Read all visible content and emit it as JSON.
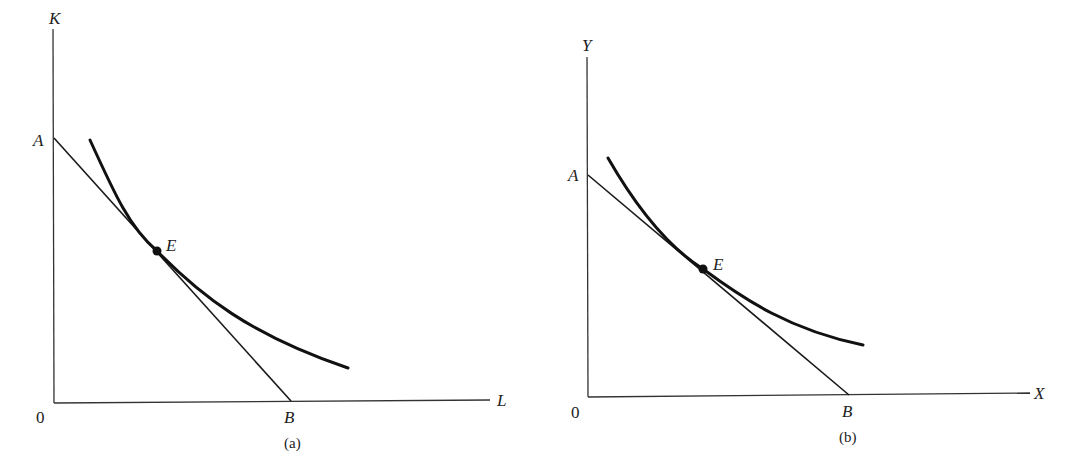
{
  "panels": [
    {
      "id": "a",
      "caption": "(a)",
      "y_axis_label": "K",
      "x_axis_label": "L",
      "origin_label": "0",
      "intercept_y_label": "A",
      "intercept_x_label": "B",
      "tangency_label": "E",
      "elements": [
        "budget/isocost line AB",
        "convex curve tangent at E"
      ]
    },
    {
      "id": "b",
      "caption": "(b)",
      "y_axis_label": "Y",
      "x_axis_label": "X",
      "origin_label": "0",
      "intercept_y_label": "A",
      "intercept_x_label": "B",
      "tangency_label": "E",
      "elements": [
        "budget line AB",
        "convex curve tangent at E"
      ]
    }
  ],
  "colors": {
    "line": "#1a1a1a",
    "background": "#ffffff"
  }
}
